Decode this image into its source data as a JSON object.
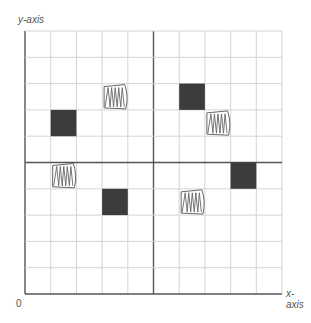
{
  "labels": {
    "y_axis": "y-axis",
    "x_axis": "x-axis",
    "origin": "0"
  },
  "grid": {
    "columns": 10,
    "rows": 10,
    "left": 25,
    "top": 31,
    "right": 282,
    "bottom": 294,
    "mid_col": 5,
    "mid_row": 5,
    "line_color": "#d4d4d4",
    "axis_color": "#555555"
  },
  "filled_squares": [
    {
      "col": 1,
      "row": 3
    },
    {
      "col": 6,
      "row": 2
    },
    {
      "col": 3,
      "row": 6
    },
    {
      "col": 8,
      "row": 5
    }
  ],
  "scribbled_squares": [
    {
      "col": 3,
      "row": 2
    },
    {
      "col": 7,
      "row": 3
    },
    {
      "col": 1,
      "row": 5
    },
    {
      "col": 6,
      "row": 6
    }
  ],
  "colors": {
    "filled": "#3c3c3c",
    "scribble": "#666666"
  }
}
